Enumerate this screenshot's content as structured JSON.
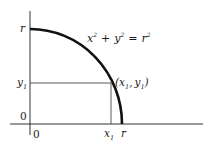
{
  "diagram": {
    "equation": {
      "lhs_x": "x",
      "lhs_plus": "+",
      "lhs_y": "y",
      "equals": "=",
      "rhs_r": "r",
      "exponent": "2"
    },
    "point_label": {
      "open": "(",
      "x": "x",
      "x_sub": "1",
      "comma": ",",
      "y": "y",
      "y_sub": "1",
      "close": ")"
    },
    "y_axis_labels": {
      "r": "r",
      "y1": "y",
      "y1_sub": "1",
      "zero": "0"
    },
    "x_axis_labels": {
      "zero": "0",
      "x1": "x",
      "x1_sub": "1",
      "r": "r"
    },
    "colors": {
      "curve": "#111111",
      "axes": "#333333",
      "guide_lines": "#444444",
      "text": "#1a1a1a"
    }
  }
}
